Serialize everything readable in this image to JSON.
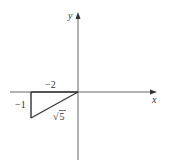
{
  "diagram": {
    "axes": {
      "x_label": "x",
      "y_label": "y"
    },
    "triangle": {
      "horizontal_leg_label": "−2",
      "vertical_leg_label": "−1",
      "hypotenuse_label_radical": "√",
      "hypotenuse_label_value": "5"
    },
    "colors": {
      "axis": "#555555",
      "triangle": "#333333",
      "text": "#333333"
    }
  }
}
